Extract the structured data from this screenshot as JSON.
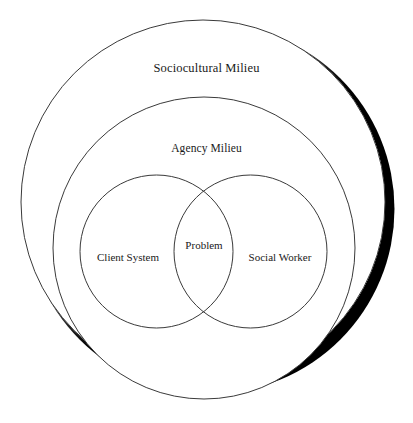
{
  "diagram": {
    "type": "nested-venn-diagram",
    "background_color": "#ffffff",
    "stroke_color": "#3a3a3a",
    "shadow_color": "#000000",
    "labels": {
      "outer_ring": "Sociocultural Milieu",
      "middle_ring": "Agency Milieu",
      "left_set": "Client System",
      "right_set": "Social Worker",
      "intersection": "Problem"
    },
    "shapes": [
      {
        "name": "sociocultural-milieu-circle",
        "label": "Sociocultural Milieu",
        "cx": 203,
        "cy": 202,
        "r": 182,
        "has_drop_shadow": true
      },
      {
        "name": "agency-milieu-circle",
        "label": "Agency Milieu",
        "cx": 204,
        "cy": 248,
        "r": 151,
        "has_drop_shadow": false
      },
      {
        "name": "client-system-circle",
        "label": "Client System",
        "cx": 156.5,
        "cy": 251.5,
        "r": 76.5,
        "has_drop_shadow": false
      },
      {
        "name": "social-worker-circle",
        "label": "Social Worker",
        "cx": 250.5,
        "cy": 251.5,
        "r": 76.5,
        "has_drop_shadow": false
      }
    ]
  }
}
